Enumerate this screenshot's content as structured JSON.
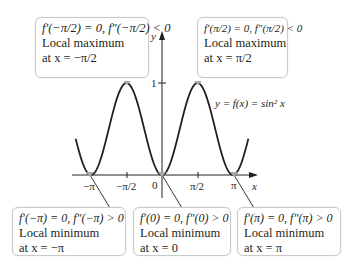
{
  "figure": {
    "curve_label": "y = f(x) = sin² x",
    "axis_labels": {
      "x": "x",
      "y": "y"
    },
    "x_ticks": [
      "−π",
      "−π/2",
      "0",
      "π/2",
      "π"
    ],
    "y_ticks": [
      "1"
    ]
  },
  "callouts": [
    {
      "id": "max-neg-half-pi",
      "condition": "f′(−π/2) = 0, f″(−π/2) < 0",
      "type": "Local maximum",
      "location": "at x = −π/2"
    },
    {
      "id": "max-half-pi",
      "condition": "f′(π/2) = 0, f″(π/2) < 0",
      "type": "Local maximum",
      "location": "at x = π/2"
    },
    {
      "id": "min-neg-pi",
      "condition": "f′(−π) = 0, f″(−π) > 0",
      "type": "Local minimum",
      "location": "at x = −π"
    },
    {
      "id": "min-zero",
      "condition": "f′(0) = 0, f″(0) > 0",
      "type": "Local minimum",
      "location": "at x = 0"
    },
    {
      "id": "min-pi",
      "condition": "f′(π) = 0, f″(π) > 0",
      "type": "Local minimum",
      "location": "at x = π"
    }
  ],
  "colors": {
    "curve": "#231f20",
    "axis": "#231f20",
    "marker": "#a7a9ac",
    "callout_border": "#c9c9c9"
  }
}
